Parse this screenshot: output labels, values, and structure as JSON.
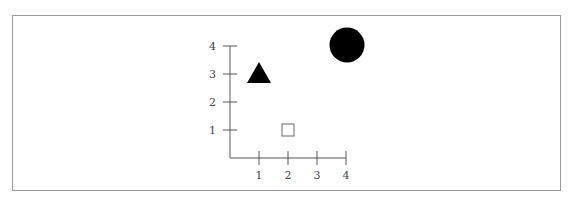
{
  "header": {
    "cut_off_text": "· · · · · · · ·"
  },
  "chart_data": {
    "type": "scatter",
    "title": "",
    "xlabel": "",
    "ylabel": "",
    "xlim": [
      0,
      4
    ],
    "ylim": [
      0,
      4
    ],
    "x_ticks": [
      1,
      2,
      3,
      4
    ],
    "y_ticks": [
      1,
      2,
      3,
      4
    ],
    "grid": false,
    "legend": null,
    "points": [
      {
        "x": 1,
        "y": 3,
        "marker": "triangle",
        "fill": "#000000",
        "size": "large"
      },
      {
        "x": 2,
        "y": 1,
        "marker": "square",
        "fill": "none",
        "stroke": "#666666",
        "size": "small"
      },
      {
        "x": 4,
        "y": 4,
        "marker": "circle",
        "fill": "#000000",
        "size": "large"
      }
    ]
  },
  "colors": {
    "axis": "#555555",
    "frame": "#9a9a9a",
    "marker_fill": "#000000"
  }
}
